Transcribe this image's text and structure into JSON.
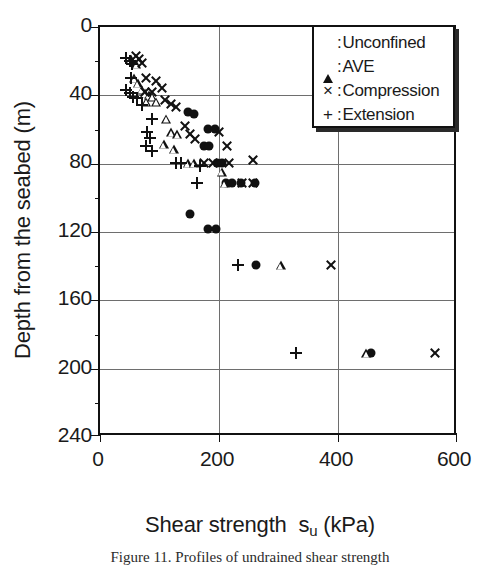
{
  "figure": {
    "caption": "Figure 11. Profiles of undrained shear strength"
  },
  "axes": {
    "x_title_main": "Shear strength",
    "x_title_symbol": "s",
    "x_title_subscript": "u",
    "x_title_unit": "(kPa)",
    "y_title": "Depth from the seabed (m)",
    "x_ticks": [
      "0",
      "200",
      "400",
      "600"
    ],
    "y_ticks": [
      "0",
      "40",
      "80",
      "120",
      "160",
      "200",
      "240"
    ]
  },
  "legend": {
    "entries": [
      {
        "marker": "circle-filled-icon",
        "glyph": "●",
        "separator": ":",
        "label": "Unconfined"
      },
      {
        "marker": "triangle-open-icon",
        "glyph": "△",
        "separator": ":",
        "label": "AVE"
      },
      {
        "marker": "cross-icon",
        "glyph": "×",
        "separator": ":",
        "label": "Compression"
      },
      {
        "marker": "plus-icon",
        "glyph": "+",
        "separator": ":",
        "label": "Extension"
      }
    ]
  },
  "chart_data": {
    "type": "scatter",
    "title": "",
    "xlabel": "Shear strength s_u (kPa)",
    "ylabel": "Depth from the seabed (m)",
    "xlim": [
      0,
      600
    ],
    "ylim": [
      0,
      240
    ],
    "y_inverted": true,
    "xticks": [
      0,
      200,
      400,
      600
    ],
    "yticks": [
      0,
      40,
      80,
      120,
      160,
      200,
      240
    ],
    "grid": true,
    "legend_position": "top-right",
    "series": [
      {
        "name": "Unconfined",
        "marker": "filled-circle",
        "points": [
          [
            148,
            50
          ],
          [
            158,
            51
          ],
          [
            182,
            60
          ],
          [
            193,
            60
          ],
          [
            175,
            70
          ],
          [
            183,
            70
          ],
          [
            198,
            80
          ],
          [
            205,
            80
          ],
          [
            213,
            92
          ],
          [
            222,
            92
          ],
          [
            238,
            92
          ],
          [
            262,
            92
          ],
          [
            152,
            110
          ],
          [
            182,
            119
          ],
          [
            196,
            119
          ],
          [
            263,
            140
          ],
          [
            456,
            192
          ]
        ]
      },
      {
        "name": "AVE",
        "marker": "open-triangle",
        "points": [
          [
            52,
            19
          ],
          [
            61,
            22
          ],
          [
            58,
            30
          ],
          [
            64,
            33
          ],
          [
            70,
            37
          ],
          [
            76,
            39
          ],
          [
            82,
            40
          ],
          [
            88,
            41
          ],
          [
            78,
            44
          ],
          [
            95,
            44
          ],
          [
            112,
            54
          ],
          [
            120,
            62
          ],
          [
            130,
            63
          ],
          [
            108,
            69
          ],
          [
            124,
            72
          ],
          [
            148,
            80
          ],
          [
            158,
            80
          ],
          [
            205,
            85
          ],
          [
            210,
            92
          ],
          [
            305,
            140
          ],
          [
            449,
            192
          ]
        ]
      },
      {
        "name": "Compression",
        "marker": "cross",
        "points": [
          [
            60,
            17
          ],
          [
            66,
            19
          ],
          [
            70,
            21
          ],
          [
            78,
            30
          ],
          [
            95,
            32
          ],
          [
            75,
            38
          ],
          [
            88,
            38
          ],
          [
            104,
            36
          ],
          [
            110,
            43
          ],
          [
            120,
            45
          ],
          [
            128,
            47
          ],
          [
            143,
            58
          ],
          [
            152,
            63
          ],
          [
            160,
            66
          ],
          [
            200,
            62
          ],
          [
            214,
            70
          ],
          [
            176,
            80
          ],
          [
            190,
            80
          ],
          [
            218,
            80
          ],
          [
            258,
            78
          ],
          [
            240,
            92
          ],
          [
            258,
            92
          ],
          [
            390,
            140
          ],
          [
            565,
            192
          ]
        ]
      },
      {
        "name": "Extension",
        "marker": "plus",
        "points": [
          [
            44,
            18
          ],
          [
            50,
            20
          ],
          [
            54,
            22
          ],
          [
            52,
            30
          ],
          [
            44,
            37
          ],
          [
            50,
            39
          ],
          [
            56,
            41
          ],
          [
            62,
            42
          ],
          [
            70,
            46
          ],
          [
            88,
            54
          ],
          [
            80,
            62
          ],
          [
            84,
            65
          ],
          [
            78,
            70
          ],
          [
            88,
            73
          ],
          [
            128,
            80
          ],
          [
            136,
            80
          ],
          [
            168,
            82
          ],
          [
            163,
            92
          ],
          [
            232,
            140
          ],
          [
            330,
            192
          ]
        ]
      }
    ]
  }
}
